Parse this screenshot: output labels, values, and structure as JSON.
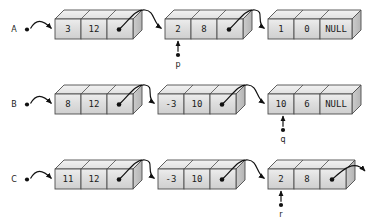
{
  "diagram": {
    "type": "linked-list-diagram",
    "colors": {
      "background": "#ffffff",
      "cell_fill": "#d9d9d9",
      "cell_fill_light": "#ececec",
      "top_face": "#e8e8e8",
      "side_face": "#c0c0c0",
      "stroke": "#4d4d4d",
      "text": "#1a1a1a",
      "arrow": "#111111"
    },
    "geometry": {
      "depth_x": 9,
      "depth_y": 9,
      "cell_w": 26,
      "cell_w_null": 32,
      "node_h": 20
    }
  },
  "rows": [
    {
      "id": "row-a",
      "head_label": "A",
      "head_x": 14,
      "head_dot_x": 27,
      "y": 19,
      "nodes": [
        {
          "id": "a1",
          "x": 55,
          "cells": [
            {
              "kind": "value",
              "text": "3"
            },
            {
              "kind": "value",
              "text": "12"
            },
            {
              "kind": "pointer",
              "text": ""
            }
          ]
        },
        {
          "id": "a2",
          "x": 165,
          "cells": [
            {
              "kind": "value",
              "text": "2"
            },
            {
              "kind": "value",
              "text": "8"
            },
            {
              "kind": "pointer",
              "text": ""
            }
          ]
        },
        {
          "id": "a3",
          "x": 268,
          "null_node": true,
          "cells": [
            {
              "kind": "value",
              "text": "1"
            },
            {
              "kind": "value",
              "text": "0"
            },
            {
              "kind": "null",
              "text": "NULL"
            }
          ]
        }
      ],
      "pointer": {
        "label": "p",
        "x": 178,
        "label_y": 64,
        "tip_y": 41,
        "dot_y": 55
      }
    },
    {
      "id": "row-b",
      "head_label": "B",
      "head_x": 14,
      "head_dot_x": 27,
      "y": 94,
      "nodes": [
        {
          "id": "b1",
          "x": 55,
          "cells": [
            {
              "kind": "value",
              "text": "8"
            },
            {
              "kind": "value",
              "text": "12"
            },
            {
              "kind": "pointer",
              "text": ""
            }
          ]
        },
        {
          "id": "b2",
          "x": 158,
          "cells": [
            {
              "kind": "value",
              "text": "-3"
            },
            {
              "kind": "value",
              "text": "10"
            },
            {
              "kind": "pointer",
              "text": ""
            }
          ]
        },
        {
          "id": "b3",
          "x": 268,
          "null_node": true,
          "cells": [
            {
              "kind": "value",
              "text": "10"
            },
            {
              "kind": "value",
              "text": "6"
            },
            {
              "kind": "null",
              "text": "NULL"
            }
          ]
        }
      ],
      "pointer": {
        "label": "q",
        "x": 283,
        "label_y": 139,
        "tip_y": 116,
        "dot_y": 130
      }
    },
    {
      "id": "row-c",
      "head_label": "C",
      "head_x": 14,
      "head_dot_x": 27,
      "y": 169,
      "nodes": [
        {
          "id": "c1",
          "x": 55,
          "cells": [
            {
              "kind": "value",
              "text": "11"
            },
            {
              "kind": "value",
              "text": "12"
            },
            {
              "kind": "pointer",
              "text": ""
            }
          ]
        },
        {
          "id": "c2",
          "x": 158,
          "cells": [
            {
              "kind": "value",
              "text": "-3"
            },
            {
              "kind": "value",
              "text": "10"
            },
            {
              "kind": "pointer",
              "text": ""
            }
          ]
        },
        {
          "id": "c3",
          "x": 268,
          "cells": [
            {
              "kind": "value",
              "text": "2"
            },
            {
              "kind": "value",
              "text": "8"
            },
            {
              "kind": "pointer",
              "text": ""
            }
          ]
        }
      ],
      "trailing_arrow": true,
      "pointer": {
        "label": "r",
        "x": 281,
        "label_y": 214,
        "tip_y": 191,
        "dot_y": 205
      }
    }
  ]
}
